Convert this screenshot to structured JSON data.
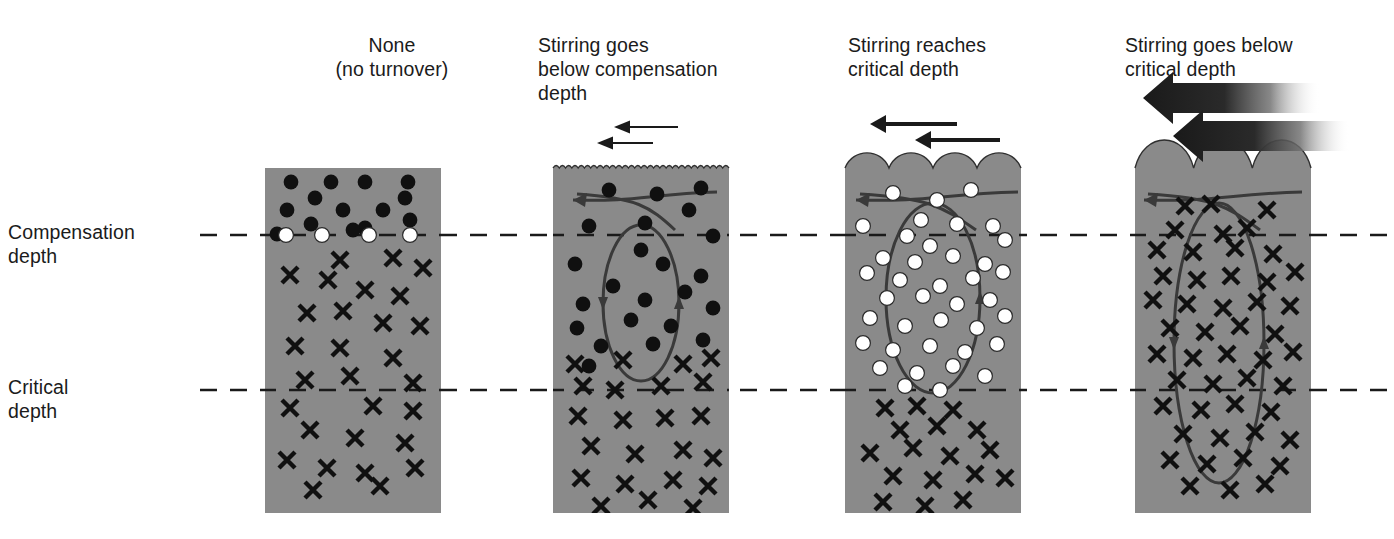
{
  "figure": {
    "type": "scientific-diagram",
    "background_color": "#ffffff",
    "water_color": "#8a8a8a",
    "ink_color": "#1a1a1a"
  },
  "depth_labels": [
    {
      "id": "compensation",
      "text": "Compensation\ndepth",
      "x": 8,
      "y": 220,
      "line_y": 235
    },
    {
      "id": "critical",
      "text": "Critical\ndepth",
      "x": 8,
      "y": 375,
      "line_y": 390
    }
  ],
  "columns": [
    {
      "id": "none",
      "header": "None\n(no turnover)",
      "header_x": 312,
      "header_y": 33,
      "header_align": "center",
      "header_width": 160,
      "box": {
        "x": 265,
        "y": 168,
        "w": 176,
        "h": 345
      },
      "surface": "flat",
      "surface_amplitude": 0,
      "has_mixing_loop": false,
      "has_surface_arrows": false,
      "arrow_style": "none",
      "symbols": {
        "filled_dots": [
          [
            26,
            14
          ],
          [
            66,
            14
          ],
          [
            100,
            14
          ],
          [
            143,
            14
          ],
          [
            50,
            30
          ],
          [
            140,
            30
          ],
          [
            22,
            42
          ],
          [
            78,
            42
          ],
          [
            118,
            42
          ],
          [
            46,
            56
          ],
          [
            100,
            60
          ],
          [
            145,
            52
          ],
          [
            12,
            66
          ],
          [
            88,
            62
          ]
        ],
        "open_dots": [
          [
            21,
            67
          ],
          [
            57,
            67
          ],
          [
            104,
            67
          ],
          [
            145,
            67
          ]
        ],
        "crosses": [
          [
            75,
            92
          ],
          [
            128,
            90
          ],
          [
            158,
            100
          ],
          [
            25,
            107
          ],
          [
            63,
            112
          ],
          [
            100,
            122
          ],
          [
            135,
            128
          ],
          [
            42,
            145
          ],
          [
            78,
            143
          ],
          [
            118,
            155
          ],
          [
            155,
            158
          ],
          [
            30,
            178
          ],
          [
            75,
            180
          ],
          [
            128,
            190
          ],
          [
            40,
            212
          ],
          [
            85,
            208
          ],
          [
            148,
            215
          ],
          [
            25,
            240
          ],
          [
            108,
            238
          ],
          [
            148,
            243
          ],
          [
            45,
            262
          ],
          [
            90,
            270
          ],
          [
            140,
            275
          ],
          [
            22,
            292
          ],
          [
            62,
            300
          ],
          [
            100,
            305
          ],
          [
            150,
            300
          ],
          [
            48,
            322
          ],
          [
            115,
            318
          ]
        ]
      }
    },
    {
      "id": "below-compensation",
      "header": "Stirring goes\nbelow compensation\ndepth",
      "header_x": 538,
      "header_y": 33,
      "header_align": "left",
      "header_width": 230,
      "box": {
        "x": 553,
        "y": 168,
        "w": 176,
        "h": 345
      },
      "surface": "ripple",
      "surface_amplitude": 5,
      "has_mixing_loop": true,
      "loop": {
        "cx": 88,
        "cy": 135,
        "rx": 38,
        "ry": 78
      },
      "has_surface_arrows": true,
      "arrow_style": "thin",
      "surface_arrows": [
        {
          "x1": 125,
          "x2": 61,
          "y": -41,
          "width": 2
        },
        {
          "x1": 100,
          "x2": 44,
          "y": -25,
          "width": 2
        }
      ],
      "symbols": {
        "filled_dots": [
          [
            56,
            22
          ],
          [
            104,
            26
          ],
          [
            148,
            20
          ],
          [
            36,
            58
          ],
          [
            92,
            55
          ],
          [
            136,
            42
          ],
          [
            160,
            68
          ],
          [
            88,
            82
          ],
          [
            22,
            96
          ],
          [
            110,
            96
          ],
          [
            148,
            108
          ],
          [
            60,
            118
          ],
          [
            30,
            136
          ],
          [
            92,
            132
          ],
          [
            132,
            124
          ],
          [
            160,
            140
          ],
          [
            24,
            160
          ],
          [
            78,
            152
          ],
          [
            118,
            158
          ],
          [
            48,
            178
          ],
          [
            100,
            176
          ],
          [
            150,
            172
          ],
          [
            36,
            198
          ]
        ],
        "open_dots": [],
        "crosses": [
          [
            22,
            196
          ],
          [
            70,
            192
          ],
          [
            130,
            196
          ],
          [
            158,
            190
          ],
          [
            30,
            218
          ],
          [
            62,
            222
          ],
          [
            108,
            218
          ],
          [
            150,
            214
          ],
          [
            25,
            248
          ],
          [
            70,
            252
          ],
          [
            112,
            250
          ],
          [
            148,
            248
          ],
          [
            38,
            278
          ],
          [
            82,
            286
          ],
          [
            130,
            282
          ],
          [
            160,
            290
          ],
          [
            28,
            310
          ],
          [
            72,
            316
          ],
          [
            120,
            312
          ],
          [
            155,
            318
          ],
          [
            48,
            338
          ],
          [
            95,
            332
          ],
          [
            140,
            340
          ]
        ]
      }
    },
    {
      "id": "reaches-critical",
      "header": "Stirring reaches\ncritical depth",
      "header_x": 848,
      "header_y": 33,
      "header_align": "left",
      "header_width": 210,
      "box": {
        "x": 845,
        "y": 168,
        "w": 176,
        "h": 345
      },
      "surface": "scallop",
      "surface_amplitude": 13,
      "has_mixing_loop": true,
      "loop": {
        "cx": 88,
        "cy": 130,
        "rx": 47,
        "ry": 95
      },
      "has_surface_arrows": true,
      "arrow_style": "medium",
      "surface_arrows": [
        {
          "x1": 112,
          "x2": 25,
          "y": -44,
          "width": 4
        },
        {
          "x1": 155,
          "x2": 70,
          "y": -28,
          "width": 4
        }
      ],
      "symbols": {
        "filled_dots": [],
        "open_dots": [
          [
            48,
            25
          ],
          [
            92,
            32
          ],
          [
            126,
            22
          ],
          [
            18,
            58
          ],
          [
            76,
            52
          ],
          [
            112,
            56
          ],
          [
            148,
            58
          ],
          [
            62,
            68
          ],
          [
            85,
            78
          ],
          [
            160,
            72
          ],
          [
            38,
            90
          ],
          [
            70,
            94
          ],
          [
            108,
            88
          ],
          [
            140,
            96
          ],
          [
            22,
            105
          ],
          [
            55,
            112
          ],
          [
            95,
            118
          ],
          [
            128,
            110
          ],
          [
            158,
            104
          ],
          [
            42,
            130
          ],
          [
            78,
            128
          ],
          [
            112,
            136
          ],
          [
            145,
            132
          ],
          [
            25,
            150
          ],
          [
            60,
            158
          ],
          [
            96,
            152
          ],
          [
            132,
            160
          ],
          [
            160,
            148
          ],
          [
            18,
            175
          ],
          [
            48,
            182
          ],
          [
            85,
            178
          ],
          [
            120,
            184
          ],
          [
            152,
            176
          ],
          [
            35,
            200
          ],
          [
            72,
            205
          ],
          [
            108,
            198
          ],
          [
            140,
            208
          ],
          [
            60,
            218
          ],
          [
            95,
            222
          ]
        ],
        "crosses": [
          [
            40,
            240
          ],
          [
            72,
            238
          ],
          [
            108,
            242
          ],
          [
            55,
            262
          ],
          [
            92,
            258
          ],
          [
            132,
            262
          ],
          [
            25,
            285
          ],
          [
            68,
            280
          ],
          [
            105,
            288
          ],
          [
            145,
            282
          ],
          [
            48,
            308
          ],
          [
            88,
            312
          ],
          [
            130,
            306
          ],
          [
            160,
            310
          ],
          [
            38,
            334
          ],
          [
            80,
            338
          ],
          [
            118,
            332
          ]
        ]
      }
    },
    {
      "id": "below-critical",
      "header": "Stirring goes below\ncritical depth",
      "header_x": 1125,
      "header_y": 33,
      "header_align": "left",
      "header_width": 230,
      "box": {
        "x": 1135,
        "y": 168,
        "w": 176,
        "h": 345
      },
      "surface": "bigscallop",
      "surface_amplitude": 22,
      "has_mixing_loop": true,
      "loop": {
        "cx": 84,
        "cy": 175,
        "rx": 45,
        "ry": 140
      },
      "has_surface_arrows": true,
      "arrow_style": "thick-gradient",
      "surface_arrows": [
        {
          "x1": 185,
          "x2": 8,
          "y": -70,
          "width": 30
        },
        {
          "x1": 215,
          "x2": 38,
          "y": -32,
          "width": 30
        }
      ],
      "symbols": {
        "filled_dots": [],
        "open_dots": [],
        "crosses": [
          [
            50,
            38
          ],
          [
            76,
            36
          ],
          [
            132,
            42
          ],
          [
            40,
            62
          ],
          [
            88,
            66
          ],
          [
            112,
            60
          ],
          [
            22,
            82
          ],
          [
            58,
            84
          ],
          [
            100,
            80
          ],
          [
            138,
            86
          ],
          [
            28,
            108
          ],
          [
            62,
            112
          ],
          [
            96,
            108
          ],
          [
            132,
            114
          ],
          [
            160,
            104
          ],
          [
            18,
            132
          ],
          [
            52,
            136
          ],
          [
            88,
            140
          ],
          [
            122,
            134
          ],
          [
            155,
            138
          ],
          [
            35,
            160
          ],
          [
            70,
            164
          ],
          [
            105,
            158
          ],
          [
            140,
            166
          ],
          [
            22,
            186
          ],
          [
            58,
            190
          ],
          [
            92,
            186
          ],
          [
            128,
            192
          ],
          [
            158,
            184
          ],
          [
            42,
            212
          ],
          [
            78,
            216
          ],
          [
            112,
            210
          ],
          [
            148,
            218
          ],
          [
            28,
            238
          ],
          [
            66,
            242
          ],
          [
            100,
            236
          ],
          [
            136,
            244
          ],
          [
            48,
            266
          ],
          [
            85,
            270
          ],
          [
            120,
            264
          ],
          [
            155,
            272
          ],
          [
            35,
            292
          ],
          [
            72,
            296
          ],
          [
            108,
            290
          ],
          [
            145,
            298
          ],
          [
            55,
            318
          ],
          [
            95,
            322
          ],
          [
            130,
            316
          ]
        ]
      }
    }
  ],
  "legend_semantics": {
    "filled_dot": "phytoplankton-cell-net-growth",
    "open_dot": "phytoplankton-cell-neutral",
    "cross": "phytoplankton-cell-net-loss"
  }
}
